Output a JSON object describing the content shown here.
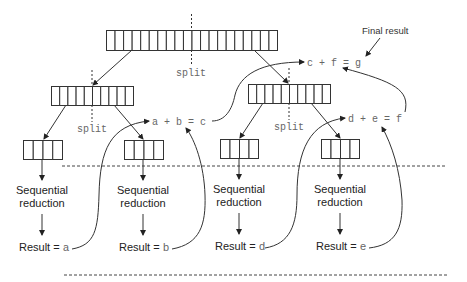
{
  "diagram": {
    "title_annotation": "Final result",
    "split_label": "split",
    "top_array": {
      "cells": 20
    },
    "mid_arrays": [
      {
        "cells": 10
      },
      {
        "cells": 10
      }
    ],
    "leaf_arrays": [
      {
        "cells": 4
      },
      {
        "cells": 4
      },
      {
        "cells": 4
      },
      {
        "cells": 4
      }
    ],
    "step_label_line1": "Sequential",
    "step_label_line2": "reduction",
    "result_prefix": "Result = ",
    "leaves": [
      {
        "result_var": "a"
      },
      {
        "result_var": "b"
      },
      {
        "result_var": "d"
      },
      {
        "result_var": "e"
      }
    ],
    "combine_equations": [
      "a + b = c",
      "d + e = f",
      "c + f = g"
    ]
  }
}
